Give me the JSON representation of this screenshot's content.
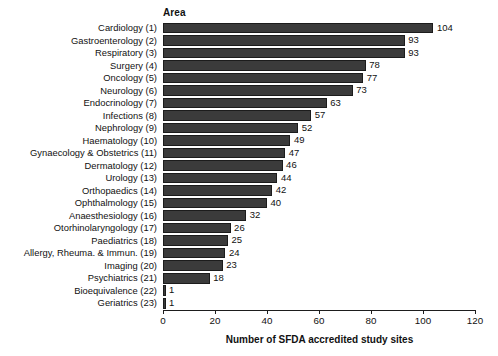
{
  "chart_data": {
    "type": "bar",
    "orientation": "horizontal",
    "title": "",
    "group_header": "Area",
    "xlabel": "Number of SFDA accredited study sites",
    "ylabel": "",
    "xlim": [
      0,
      120
    ],
    "xticks": [
      0,
      20,
      40,
      60,
      80,
      100,
      120
    ],
    "grid": false,
    "legend": "none",
    "bar_color": "#3b3b3b",
    "categories": [
      "Cardiology (1)",
      "Gastroenterology (2)",
      "Respiratory (3)",
      "Surgery (4)",
      "Oncology (5)",
      "Neurology (6)",
      "Endocrinology (7)",
      "Infections (8)",
      "Nephrology (9)",
      "Haematology (10)",
      "Gynaecology & Obstetrics (11)",
      "Dermatology (12)",
      "Urology (13)",
      "Orthopaedics (14)",
      "Ophthalmology (15)",
      "Anaesthesiology (16)",
      "Otorhinolaryngology (17)",
      "Paediatrics (18)",
      "Allergy, Rheuma. & Immun. (19)",
      "Imaging (20)",
      "Psychiatrics (21)",
      "Bioequivalence (22)",
      "Geriatrics (23)"
    ],
    "values": [
      104,
      93,
      93,
      78,
      77,
      73,
      63,
      57,
      52,
      49,
      47,
      46,
      44,
      42,
      40,
      32,
      26,
      25,
      24,
      23,
      18,
      1,
      1
    ]
  }
}
